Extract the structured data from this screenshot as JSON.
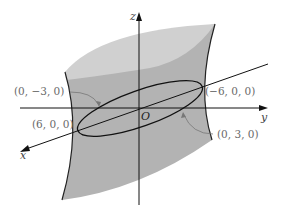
{
  "figure": {
    "type": "hyperboloid-of-one-sheet",
    "axes": {
      "x": "x",
      "y": "y",
      "z": "z"
    },
    "origin": "O",
    "points": [
      {
        "label": "(0, −3, 0)",
        "id": "neg-y-point"
      },
      {
        "label": "(−6, 0, 0)",
        "id": "neg-x-point"
      },
      {
        "label": "(6, 0, 0)",
        "id": "pos-x-point"
      },
      {
        "label": "(0, 3, 0)",
        "id": "pos-y-point"
      }
    ],
    "colors": {
      "surface_side": "#b3b3b3",
      "surface_top": "#cfcfcf",
      "edge": "#222222",
      "axis": "#111111",
      "label": "#6a6a6a",
      "background": "#ffffff"
    }
  }
}
